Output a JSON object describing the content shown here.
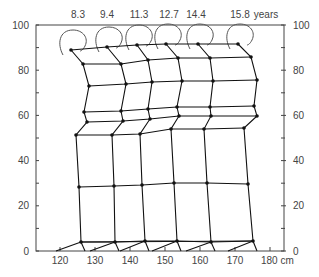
{
  "chart_data": {
    "type": "diagram",
    "title": "",
    "x_axis": {
      "unit_label": "cm",
      "ticks": [
        {
          "label": "120",
          "px": 60
        },
        {
          "label": "130",
          "px": 95
        },
        {
          "label": "140",
          "px": 130
        },
        {
          "label": "150",
          "px": 165
        },
        {
          "label": "160",
          "px": 200
        },
        {
          "label": "170",
          "px": 235
        },
        {
          "label": "180 cm",
          "px": 270
        }
      ],
      "minor_ticks_px": [
        60,
        95,
        130,
        165,
        200,
        235,
        270
      ]
    },
    "y_axis_left": {
      "ticks": [
        {
          "label": "0",
          "value": 0
        },
        {
          "label": "20",
          "value": 20
        },
        {
          "label": "40",
          "value": 40
        },
        {
          "label": "60",
          "value": 60
        },
        {
          "label": "80",
          "value": 80
        },
        {
          "label": "100",
          "value": 100
        }
      ]
    },
    "y_axis_right": {
      "ticks": [
        {
          "label": "0",
          "value": 0
        },
        {
          "label": "20",
          "value": 20
        },
        {
          "label": "40",
          "value": 40
        },
        {
          "label": "60",
          "value": 60
        },
        {
          "label": "80",
          "value": 80
        },
        {
          "label": "100",
          "value": 100
        }
      ]
    },
    "age_labels": [
      {
        "label": "8.3",
        "x": 78
      },
      {
        "label": "9.4",
        "x": 107
      },
      {
        "label": "11.3",
        "x": 139
      },
      {
        "label": "12.7",
        "x": 169
      },
      {
        "label": "14.4",
        "x": 196
      },
      {
        "label": "15.8",
        "x": 240
      }
    ],
    "age_unit": {
      "label": "years",
      "x": 266
    },
    "figures": [
      {
        "age": "8.3",
        "nodes": [
          [
            71,
            50
          ],
          [
            83,
            64
          ],
          [
            89,
            86
          ],
          [
            84,
            112
          ],
          [
            87,
            122
          ],
          [
            76,
            135
          ],
          [
            79,
            187
          ],
          [
            81,
            242
          ]
        ]
      },
      {
        "age": "9.4",
        "nodes": [
          [
            107,
            47
          ],
          [
            121,
            64
          ],
          [
            126,
            84
          ],
          [
            121,
            111
          ],
          [
            123,
            121
          ],
          [
            112,
            135
          ],
          [
            114,
            186
          ],
          [
            115,
            242
          ]
        ]
      },
      {
        "age": "11.3",
        "nodes": [
          [
            137,
            45
          ],
          [
            148,
            60
          ],
          [
            152,
            82
          ],
          [
            148,
            109
          ],
          [
            150,
            119
          ],
          [
            140,
            134
          ],
          [
            142,
            185
          ],
          [
            145,
            241
          ]
        ]
      },
      {
        "age": "12.7",
        "nodes": [
          [
            166,
            44
          ],
          [
            178,
            58
          ],
          [
            182,
            81
          ],
          [
            177,
            107
          ],
          [
            179,
            116
          ],
          [
            171,
            129
          ],
          [
            174,
            183
          ],
          [
            177,
            241
          ]
        ]
      },
      {
        "age": "14.4",
        "nodes": [
          [
            198,
            44
          ],
          [
            210,
            58
          ],
          [
            213,
            81
          ],
          [
            210,
            107
          ],
          [
            211,
            116
          ],
          [
            204,
            129
          ],
          [
            207,
            183
          ],
          [
            211,
            242
          ]
        ]
      },
      {
        "age": "15.8",
        "nodes": [
          [
            238,
            44
          ],
          [
            251,
            57
          ],
          [
            257,
            80
          ],
          [
            254,
            106
          ],
          [
            257,
            116
          ],
          [
            244,
            128
          ],
          [
            248,
            184
          ],
          [
            253,
            241
          ]
        ]
      }
    ]
  }
}
